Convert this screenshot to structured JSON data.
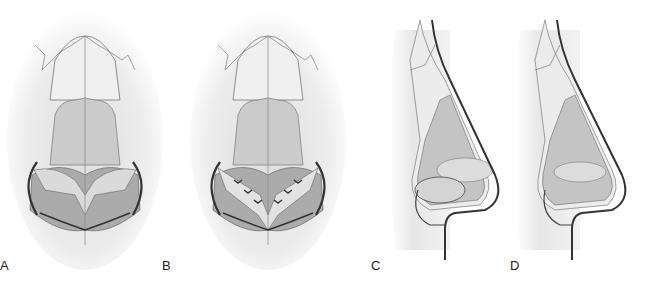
{
  "figure": {
    "panels": [
      {
        "id": "A",
        "label": "A",
        "view": "frontal",
        "x": 0
      },
      {
        "id": "B",
        "label": "B",
        "view": "frontal-sutured",
        "x": 160
      },
      {
        "id": "C",
        "label": "C",
        "view": "lateral",
        "x": 370
      },
      {
        "id": "D",
        "label": "D",
        "view": "lateral-corrected",
        "x": 500
      }
    ],
    "colors": {
      "skin_shadow": "#e6e6e6",
      "bone": "#ececec",
      "cartilage_upper": "#c9c9c9",
      "cartilage_lower": "#a9a9a9",
      "highlight": "#f4f4f4",
      "outline": "#555555",
      "arrow": "#333333"
    }
  }
}
